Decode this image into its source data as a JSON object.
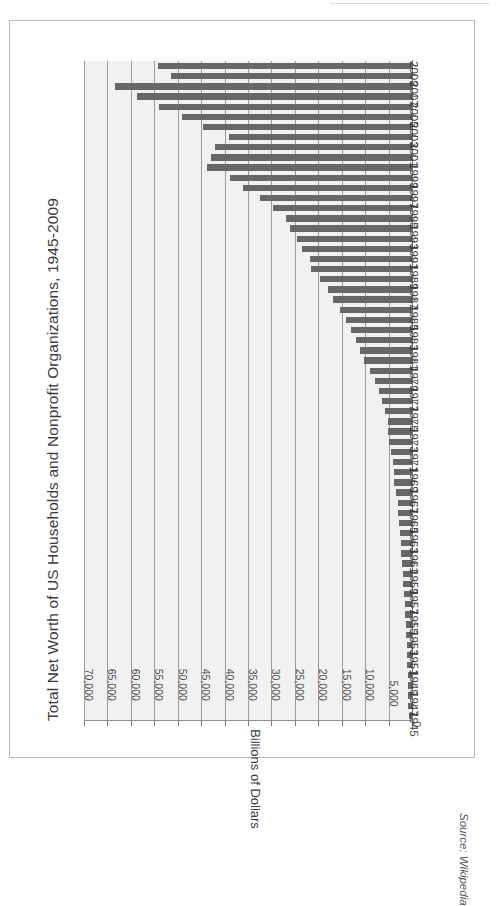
{
  "figure": {
    "title": "Total Net Worth of US Households and Nonprofit Organizations, 1945-2009",
    "source": "Source: Wikipedia"
  },
  "chart_data": {
    "type": "bar",
    "orientation": "horizontal",
    "title": "Total Net Worth of US Households and Nonprofit Organizations, 1945-2009",
    "xlabel": "Billions of Dollars",
    "ylabel": "",
    "value_axis_title": "Billions of Dollars",
    "category_axis_title": "",
    "xlim": [
      0,
      70000
    ],
    "grid": true,
    "legend": false,
    "bar_color": "#676767",
    "plot_background": "#f1f1f1",
    "gridline_color": "#9a9a9a",
    "axis_tick_labels": [
      "70,000",
      "65,000",
      "60,000",
      "55,000",
      "50,000",
      "45,000",
      "40,000",
      "35,000",
      "30,000",
      "25,000",
      "20,000",
      "15,000",
      "10,000",
      "5,000",
      "0"
    ],
    "axis_tick_values": [
      70000,
      65000,
      60000,
      55000,
      50000,
      45000,
      40000,
      35000,
      30000,
      25000,
      20000,
      15000,
      10000,
      5000,
      0
    ],
    "categories": [
      1945,
      1946,
      1947,
      1948,
      1949,
      1950,
      1951,
      1952,
      1953,
      1954,
      1955,
      1956,
      1957,
      1958,
      1959,
      1960,
      1961,
      1962,
      1963,
      1964,
      1965,
      1966,
      1967,
      1968,
      1969,
      1970,
      1971,
      1972,
      1973,
      1974,
      1975,
      1976,
      1977,
      1978,
      1979,
      1980,
      1981,
      1982,
      1983,
      1984,
      1985,
      1986,
      1987,
      1988,
      1989,
      1990,
      1991,
      1992,
      1993,
      1994,
      1995,
      1996,
      1997,
      1998,
      1999,
      2000,
      2001,
      2002,
      2003,
      2004,
      2005,
      2006,
      2007,
      2008,
      2009
    ],
    "category_labels_shown": [
      "1945",
      "1947",
      "1949",
      "1951",
      "1953",
      "1955",
      "1957",
      "1959",
      "1961",
      "1963",
      "1965",
      "1967",
      "1969",
      "1971",
      "1973",
      "1975",
      "1977",
      "1979",
      "1981",
      "1983",
      "1985",
      "1987",
      "1989",
      "1991",
      "1993",
      "1995",
      "1997",
      "1999",
      "2001",
      "2003",
      "2005",
      "2007",
      "2009"
    ],
    "values": [
      700,
      760,
      790,
      840,
      880,
      980,
      1060,
      1140,
      1200,
      1360,
      1470,
      1570,
      1620,
      1840,
      1950,
      2030,
      2250,
      2330,
      2500,
      2720,
      2960,
      3040,
      3400,
      3760,
      3870,
      4060,
      4450,
      4970,
      5180,
      5160,
      5780,
      6420,
      7020,
      7820,
      8880,
      10270,
      11160,
      11900,
      13080,
      13990,
      15400,
      16930,
      17990,
      19650,
      21480,
      21830,
      23430,
      24590,
      26060,
      26790,
      29680,
      32450,
      35990,
      38920,
      43750,
      42880,
      42130,
      39140,
      44570,
      49090,
      53980,
      58610,
      63370,
      51380,
      54170
    ]
  }
}
